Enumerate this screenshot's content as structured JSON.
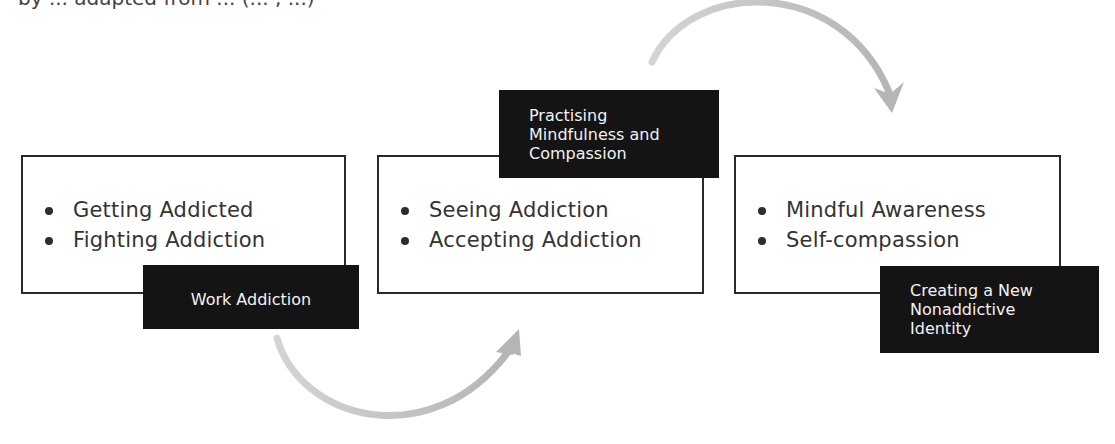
{
  "caption": {
    "partial_text": "by ... adapted from ... (... , ...)"
  },
  "colors": {
    "box_border": "#2a2a2a",
    "label_background": "#141414",
    "label_text": "#f2f2f2",
    "body_text": "#333333",
    "arrow": "#b8b8b8"
  },
  "stages": [
    {
      "label_lines": [
        "Work Addiction"
      ],
      "items": [
        "Getting Addicted",
        "Fighting Addiction"
      ]
    },
    {
      "label_lines": [
        "Practising",
        "Mindfulness and",
        "Compassion"
      ],
      "items": [
        "Seeing Addiction",
        "Accepting Addiction"
      ]
    },
    {
      "label_lines": [
        "Creating a New",
        "Nonaddictive",
        "Identity"
      ],
      "items": [
        "Mindful Awareness",
        "Self-compassion"
      ]
    }
  ],
  "connectors": [
    {
      "from": "Work Addiction",
      "to": "Practising Mindfulness and Compassion",
      "shape": "curved-arrow-below"
    },
    {
      "from": "Practising Mindfulness and Compassion",
      "to": "Creating a New Nonaddictive Identity",
      "shape": "curved-arrow-above"
    }
  ]
}
